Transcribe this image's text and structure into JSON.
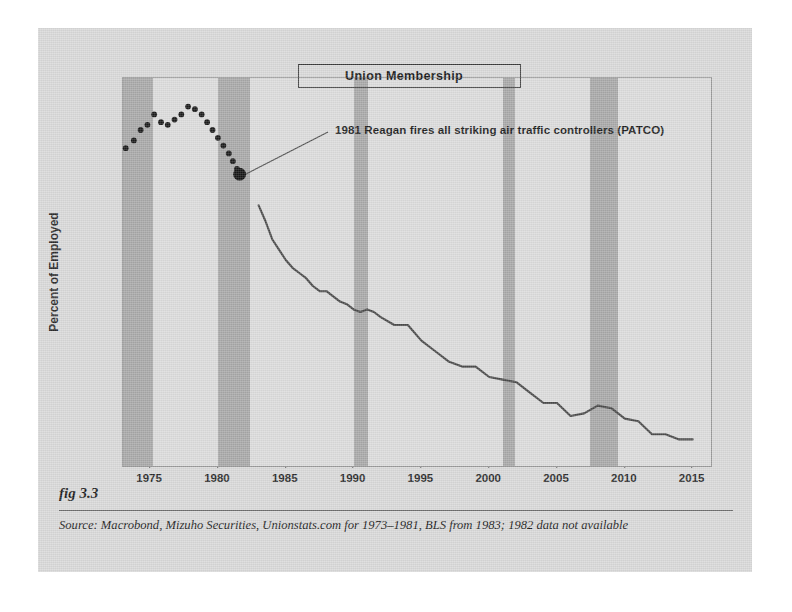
{
  "figure": {
    "fig_number": "fig 3.3",
    "source": "Source:  Macrobond, Mizuho Securities, Unionstats.com for 1973–1981, BLS from 1983; 1982 data not available"
  },
  "chart_data": {
    "type": "line",
    "title": "Union Membership",
    "xlabel": "",
    "ylabel": "Percent of Employed",
    "xlim": [
      1973,
      2016.5
    ],
    "ylim": [
      10.0,
      25.0
    ],
    "xticks": [
      1975,
      1980,
      1985,
      1990,
      1995,
      2000,
      2005,
      2010,
      2015
    ],
    "xticklabels": [
      "1975",
      "1980",
      "1985",
      "1990",
      "1995",
      "2000",
      "2005",
      "2010",
      "2015"
    ],
    "yticks": [
      10.0,
      12.5,
      15.0,
      17.5,
      20.0,
      22.5,
      25.0
    ],
    "yticklabels": [
      "10.0",
      "12.5",
      "15.0",
      "17.5",
      "20.0",
      "22.5",
      "25.0"
    ],
    "grid": false,
    "legend": false,
    "series": [
      {
        "name": "Union membership (Unionstats.com, 1973–1981)",
        "style": "scatter",
        "color": "#1a1a1a",
        "x": [
          1973.2,
          1973.8,
          1974.3,
          1974.8,
          1975.3,
          1975.8,
          1976.3,
          1976.8,
          1977.3,
          1977.8,
          1978.3,
          1978.8,
          1979.2,
          1979.6,
          1980.0,
          1980.4,
          1980.8,
          1981.1,
          1981.4,
          1981.6
        ],
        "y": [
          22.3,
          22.6,
          23.0,
          23.2,
          23.6,
          23.3,
          23.2,
          23.4,
          23.6,
          23.9,
          23.8,
          23.6,
          23.3,
          23.0,
          22.7,
          22.4,
          22.1,
          21.8,
          21.5,
          21.3
        ]
      },
      {
        "name": "Union membership (BLS, from 1983)",
        "style": "line",
        "color": "#4a4a4a",
        "x": [
          1983.0,
          1983.5,
          1984.0,
          1984.5,
          1985.0,
          1985.5,
          1986.0,
          1986.5,
          1987.0,
          1987.5,
          1988.0,
          1988.5,
          1989.0,
          1989.5,
          1990.0,
          1990.5,
          1991.0,
          1991.5,
          1992.0,
          1993.0,
          1994.0,
          1995.0,
          1996.0,
          1997.0,
          1998.0,
          1999.0,
          2000.0,
          2001.0,
          2002.0,
          2003.0,
          2004.0,
          2005.0,
          2006.0,
          2007.0,
          2008.0,
          2009.0,
          2010.0,
          2011.0,
          2012.0,
          2013.0,
          2014.0,
          2015.0
        ],
        "y": [
          20.1,
          19.5,
          18.8,
          18.4,
          18.0,
          17.7,
          17.5,
          17.3,
          17.0,
          16.8,
          16.8,
          16.6,
          16.4,
          16.3,
          16.1,
          16.0,
          16.1,
          16.0,
          15.8,
          15.5,
          15.5,
          14.9,
          14.5,
          14.1,
          13.9,
          13.9,
          13.5,
          13.4,
          13.3,
          12.9,
          12.5,
          12.5,
          12.0,
          12.1,
          12.4,
          12.3,
          11.9,
          11.8,
          11.3,
          11.3,
          11.1,
          11.1
        ]
      }
    ],
    "annotations": [
      {
        "text": "1981 Reagan fires all striking air traffic controllers (PATCO)",
        "point_x": 1981.6,
        "point_y": 21.3,
        "marker": "large-dot"
      }
    ],
    "shaded_bands": {
      "label": "recession",
      "color": "#a8a8a8",
      "ranges": [
        [
          1973.0,
          1975.2
        ],
        [
          1980.0,
          1982.4
        ],
        [
          1990.0,
          1991.1
        ],
        [
          2001.0,
          2001.9
        ],
        [
          2007.4,
          2009.5
        ]
      ]
    },
    "colors": {
      "plot_background": "#dcdcdc",
      "figure_background": "#d9d9d9",
      "band": "#a8a8a8",
      "line": "#4a4a4a",
      "marker": "#1a1a1a",
      "axis_text": "#2b2b2b"
    }
  }
}
